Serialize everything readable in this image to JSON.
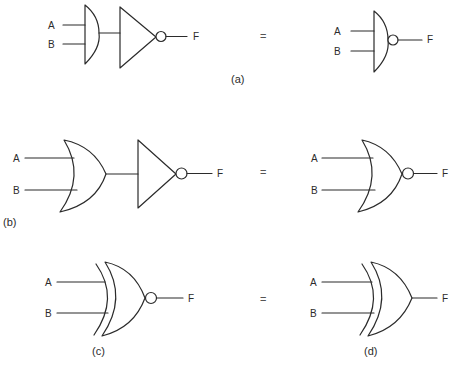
{
  "diagram": {
    "colors": {
      "line": "#2b2b2b",
      "background": "#ffffff"
    },
    "equals_sign": "=",
    "rows": [
      {
        "id": "a",
        "caption": "(a)",
        "left": {
          "description": "AND gate followed by NOT gate",
          "inputs": [
            "A",
            "B"
          ],
          "output": "F"
        },
        "right": {
          "description": "NAND gate",
          "inputs": [
            "A",
            "B"
          ],
          "output": "F"
        }
      },
      {
        "id": "b",
        "caption": "(b)",
        "left": {
          "description": "OR gate followed by NOT gate",
          "inputs": [
            "A",
            "B"
          ],
          "output": "F"
        },
        "right": {
          "description": "NOR gate",
          "inputs": [
            "A",
            "B"
          ],
          "output": "F"
        }
      },
      {
        "id": "c-d",
        "left": {
          "caption": "(c)",
          "description": "XNOR gate",
          "inputs": [
            "A",
            "B"
          ],
          "output": "F"
        },
        "right": {
          "caption": "(d)",
          "description": "XOR gate",
          "inputs": [
            "A",
            "B"
          ],
          "output": "F"
        }
      }
    ]
  }
}
